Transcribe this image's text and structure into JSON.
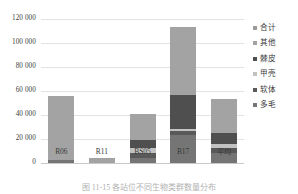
{
  "chart_data": {
    "type": "bar",
    "stacked": true,
    "title": "",
    "xlabel": "",
    "ylabel": "",
    "categories": [
      "R06",
      "R11",
      "BS05",
      "B17",
      "平均"
    ],
    "ylim": [
      0,
      120000
    ],
    "ytick_labels": [
      "0",
      "20 000",
      "40 000",
      "60 000",
      "80 000",
      "100 000",
      "120 000"
    ],
    "ytick_values": [
      0,
      20000,
      40000,
      60000,
      80000,
      100000,
      120000
    ],
    "grid": true,
    "legend_position": "right",
    "series": [
      {
        "name": "多毛",
        "color": "#757575",
        "values": [
          2300,
          0,
          4200,
          23000,
          8400
        ]
      },
      {
        "name": "软体",
        "color": "#595959",
        "values": [
          0,
          0,
          4300,
          3800,
          4300
        ]
      },
      {
        "name": "甲壳",
        "color": "#c2c2c2",
        "values": [
          0,
          0,
          4100,
          1400,
          3100
        ]
      },
      {
        "name": "棘皮",
        "color": "#4f4f4f",
        "values": [
          0,
          0,
          6200,
          28500,
          9100
        ]
      },
      {
        "name": "其他",
        "color": "#a3a3a3",
        "values": [
          53200,
          4300,
          21800,
          56400,
          28100
        ]
      },
      {
        "name": "合计",
        "color": "#9b9b9b",
        "values": [
          55500,
          4300,
          40600,
          113100,
          53000
        ]
      }
    ],
    "bar_totals": [
      55500,
      4300,
      40600,
      113100,
      53000
    ]
  },
  "legend": {
    "items": [
      {
        "label": "合计",
        "color": "#9b9b9b"
      },
      {
        "label": "其他",
        "color": "#a3a3a3"
      },
      {
        "label": "棘皮",
        "color": "#4f4f4f"
      },
      {
        "label": "甲壳",
        "color": "#c2c2c2"
      },
      {
        "label": "软体",
        "color": "#595959"
      },
      {
        "label": "多毛",
        "color": "#757575"
      }
    ]
  },
  "caption": {
    "text": "图 11-15   各站位不同生物类群数量分布"
  }
}
